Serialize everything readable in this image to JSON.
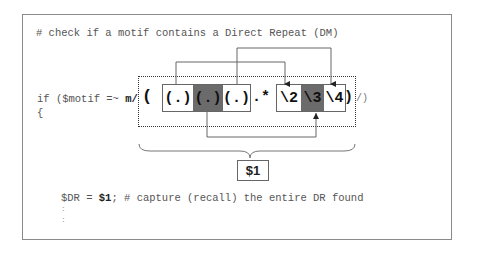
{
  "comment_line": "# check if a motif contains a Direct Repeat (DM)",
  "code": {
    "if_prefix": "if ($motif =~ ",
    "match_op": "m/",
    "open_brace": "{",
    "regex_open_paren": "(",
    "capture_groups": [
      {
        "label": "(.)",
        "shade": "white"
      },
      {
        "label": "(.)",
        "shade": "dark"
      },
      {
        "label": "(.)",
        "shade": "white"
      }
    ],
    "wildcard": ".*",
    "backrefs": [
      {
        "label": "\\2",
        "shade": "white"
      },
      {
        "label": "\\3",
        "shade": "dark"
      },
      {
        "label": "\\4",
        "shade": "white"
      }
    ],
    "regex_close_paren": ")",
    "regex_tail": "/)",
    "assign_var": "$DR = ",
    "assign_value": "$1",
    "assign_rest": "; # capture (recall) the entire DR found",
    "ellipsis_1": ":",
    "ellipsis_2": ":"
  },
  "brace_label": "$1",
  "connectors": [
    {
      "from": "capture_group_1",
      "to": "backref_2",
      "side": "top"
    },
    {
      "from": "capture_group_3",
      "to": "backref_4",
      "side": "top"
    },
    {
      "from": "capture_group_2",
      "to": "backref_3",
      "side": "bottom"
    }
  ],
  "colors": {
    "frame_border": "#8a8a8a",
    "dark_cell": "#6b6b6b",
    "line": "#555555"
  }
}
